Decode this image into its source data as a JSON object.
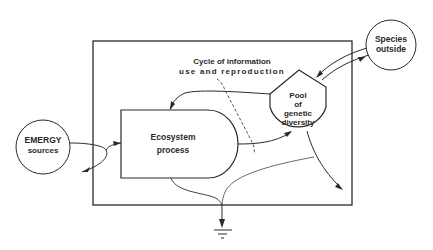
{
  "diagram": {
    "type": "energy-systems-diagram",
    "nodes": {
      "emergy_sources": {
        "line1": "EMERGY",
        "line2": "sources",
        "shape": "circle"
      },
      "ecosystem_process": {
        "line1": "Ecosystem",
        "line2": "process",
        "shape": "producer"
      },
      "genetic_pool": {
        "line1": "Pool",
        "line2": "of",
        "line3": "genetic",
        "line4": "diversity",
        "shape": "storage-tank"
      },
      "species_outside": {
        "line1": "Species",
        "line2": "outside",
        "shape": "circle"
      },
      "heat_sink": {
        "shape": "ground"
      }
    },
    "annotation": {
      "line1": "Cycle of information",
      "line2": "use and reproduction"
    },
    "colors": {
      "stroke": "#2a2a2a",
      "background": "#ffffff"
    }
  }
}
